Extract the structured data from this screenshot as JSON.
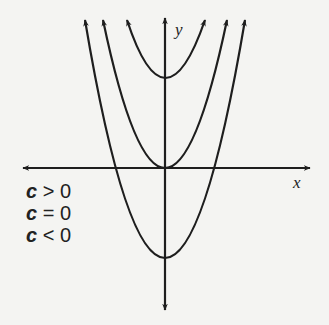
{
  "figure": {
    "type": "diagram",
    "axes": {
      "x_label": "x",
      "y_label": "y",
      "origin_px": [
        165,
        168
      ]
    },
    "curves": [
      {
        "name": "c-positive",
        "label": "c > 0",
        "vertex_px": [
          165,
          78
        ],
        "left_end_px": [
          127,
          20
        ],
        "right_end_px": [
          205,
          20
        ]
      },
      {
        "name": "c-zero",
        "label": "c = 0",
        "vertex_px": [
          165,
          168
        ],
        "left_end_px": [
          103,
          20
        ],
        "right_end_px": [
          227,
          20
        ]
      },
      {
        "name": "c-negative",
        "label": "c < 0",
        "vertex_px": [
          165,
          258
        ],
        "left_end_px": [
          85,
          20
        ],
        "right_end_px": [
          245,
          20
        ]
      }
    ],
    "stroke_color": "#1e1e1e",
    "background_color": "#f4f4f2"
  },
  "legend": {
    "items": [
      {
        "var": "c",
        "op": " > ",
        "val": "0"
      },
      {
        "var": "c",
        "op": " = ",
        "val": "0"
      },
      {
        "var": "c",
        "op": " < ",
        "val": "0"
      }
    ]
  }
}
